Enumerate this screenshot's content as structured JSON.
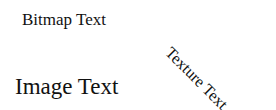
{
  "labels": {
    "bitmap_text": "Bitmap Text",
    "texture_text": "Texture Text",
    "image_text": "Image Text"
  },
  "colors": {
    "background": "#ffffff",
    "text": "#111111"
  }
}
